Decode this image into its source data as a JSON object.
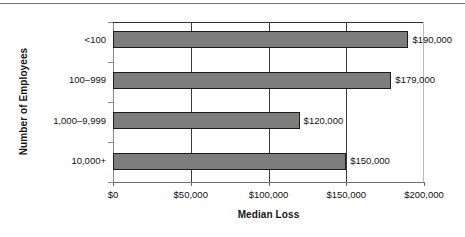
{
  "chart_data": {
    "type": "bar",
    "orientation": "horizontal",
    "title": "",
    "xlabel": "Median Loss",
    "ylabel": "Number of Employees",
    "categories": [
      "<100",
      "100–999",
      "1,000–9,999",
      "10,000+"
    ],
    "values": [
      190000,
      179000,
      120000,
      150000
    ],
    "value_labels": [
      "$190,000",
      "$179,000",
      "$120,000",
      "$150,000"
    ],
    "xlim": [
      0,
      200000
    ],
    "xticks": [
      0,
      50000,
      100000,
      150000,
      200000
    ],
    "xtick_labels": [
      "$0",
      "$50,000",
      "$100,000",
      "$150,000",
      "$200,000"
    ],
    "grid": "vertical",
    "legend": null,
    "bar_color": "#7d7d7d",
    "bar_border_color": "#1c1c1c",
    "text_color": "#111111"
  }
}
